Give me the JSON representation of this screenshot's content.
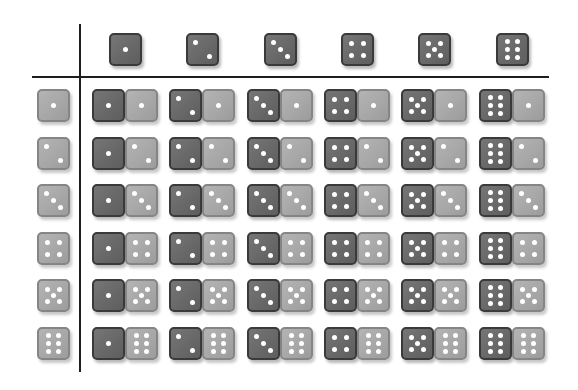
{
  "diagram": {
    "title": "",
    "column_header_values": [
      1,
      2,
      3,
      4,
      5,
      6
    ],
    "row_header_values": [
      1,
      2,
      3,
      4,
      5,
      6
    ],
    "colors": {
      "first_die_fill": "#6a6a6a",
      "first_die_border": "#3a3a3a",
      "second_die_fill": "#a8a8a8",
      "second_die_border": "#858585",
      "pip": "#ffffff",
      "grid_line": "#1e1e1e",
      "background": "#ffffff"
    },
    "cells": [
      [
        [
          1,
          1
        ],
        [
          2,
          1
        ],
        [
          3,
          1
        ],
        [
          4,
          1
        ],
        [
          5,
          1
        ],
        [
          6,
          1
        ]
      ],
      [
        [
          1,
          2
        ],
        [
          2,
          2
        ],
        [
          3,
          2
        ],
        [
          4,
          2
        ],
        [
          5,
          2
        ],
        [
          6,
          2
        ]
      ],
      [
        [
          1,
          3
        ],
        [
          2,
          3
        ],
        [
          3,
          3
        ],
        [
          4,
          3
        ],
        [
          5,
          3
        ],
        [
          6,
          3
        ]
      ],
      [
        [
          1,
          4
        ],
        [
          2,
          4
        ],
        [
          3,
          4
        ],
        [
          4,
          4
        ],
        [
          5,
          4
        ],
        [
          6,
          4
        ]
      ],
      [
        [
          1,
          5
        ],
        [
          2,
          5
        ],
        [
          3,
          5
        ],
        [
          4,
          5
        ],
        [
          5,
          5
        ],
        [
          6,
          5
        ]
      ],
      [
        [
          1,
          6
        ],
        [
          2,
          6
        ],
        [
          3,
          6
        ],
        [
          4,
          6
        ],
        [
          5,
          6
        ],
        [
          6,
          6
        ]
      ]
    ]
  }
}
